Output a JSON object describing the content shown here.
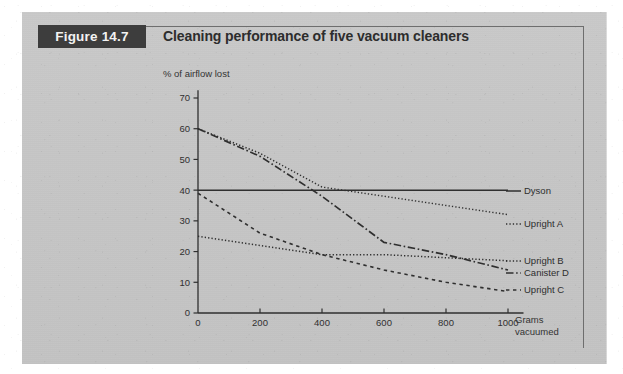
{
  "figure": {
    "tab_label": "Figure 14.7",
    "title": "Cleaning performance of five vacuum cleaners"
  },
  "axes": {
    "y_title": "% of airflow lost",
    "x_title_line1": "Grams",
    "x_title_line2": "vacuumed",
    "y_ticks": [
      "0",
      "10",
      "20",
      "30",
      "40",
      "50",
      "60",
      "70"
    ],
    "x_ticks": [
      "0",
      "200",
      "400",
      "600",
      "800",
      "1000"
    ]
  },
  "legend": {
    "dyson": "Dyson",
    "upright_a": "Upright A",
    "upright_b": "Upright B",
    "canister_d": "Canister D",
    "upright_c": "Upright C"
  },
  "colors": {
    "tab_background": "#3d3d3d",
    "tab_text": "#f2f2f2",
    "panel_background": "#c6c6c6",
    "ink": "#2d2d2d",
    "frame": "#6e6e6e"
  },
  "chart_data": {
    "type": "line",
    "title": "Cleaning performance of five vacuum cleaners",
    "xlabel": "Grams vacuumed",
    "ylabel": "% of airflow lost",
    "xlim": [
      0,
      1000
    ],
    "ylim": [
      0,
      70
    ],
    "xticks": [
      0,
      200,
      400,
      600,
      800,
      1000
    ],
    "yticks": [
      0,
      10,
      20,
      30,
      40,
      50,
      60,
      70
    ],
    "grid": false,
    "legend_position": "right-inline",
    "series": [
      {
        "name": "Dyson",
        "style": "solid",
        "x": [
          0,
          200,
          400,
          600,
          800,
          1000
        ],
        "values": [
          40,
          40,
          40,
          40,
          40,
          40
        ]
      },
      {
        "name": "Upright A",
        "style": "dotted",
        "x": [
          0,
          200,
          400,
          600,
          800,
          1000
        ],
        "values": [
          60,
          52,
          41,
          38,
          35,
          32
        ]
      },
      {
        "name": "Canister D",
        "style": "dash-dot",
        "x": [
          0,
          200,
          400,
          600,
          800,
          1000
        ],
        "values": [
          60,
          51,
          38,
          23,
          19,
          14
        ]
      },
      {
        "name": "Upright B",
        "style": "dotted",
        "x": [
          0,
          200,
          400,
          600,
          800,
          1000
        ],
        "values": [
          25,
          22,
          19,
          19,
          18,
          17
        ]
      },
      {
        "name": "Upright C",
        "style": "dashed",
        "x": [
          0,
          200,
          400,
          600,
          800,
          1000
        ],
        "values": [
          39,
          26,
          19,
          14,
          10,
          7
        ]
      }
    ]
  }
}
